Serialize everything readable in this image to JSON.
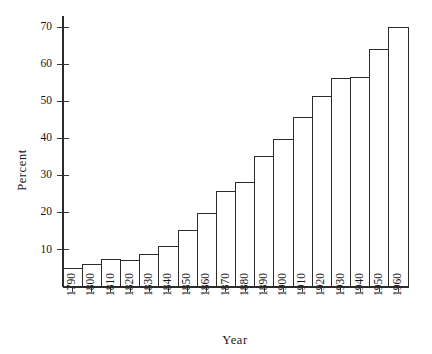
{
  "chart_data": {
    "type": "bar",
    "title": "",
    "xlabel": "Year",
    "ylabel": "Percent",
    "categories": [
      "1790",
      "1800",
      "1810",
      "1820",
      "1830",
      "1840",
      "1850",
      "1860",
      "1870",
      "1880",
      "1890",
      "1900",
      "1910",
      "1920",
      "1930",
      "1940",
      "1950",
      "1960"
    ],
    "values": [
      5.1,
      6.1,
      7.3,
      7.2,
      8.8,
      10.8,
      15.3,
      19.8,
      25.7,
      28.2,
      35.1,
      39.6,
      45.6,
      51.2,
      56.1,
      56.5,
      64.0,
      69.9
    ],
    "ylim": [
      0,
      73
    ],
    "yticks": [
      10,
      20,
      30,
      40,
      50,
      60,
      70
    ],
    "ytick_labels": [
      "10",
      "20",
      "30",
      "40",
      "50",
      "60",
      "70"
    ],
    "grid": false,
    "legend": "none",
    "bar_fill": "#ffffff",
    "bar_stroke": "#2b2b2b",
    "axis_color": "#2b2b2b",
    "xtick_rotation": -90
  },
  "axes": {
    "y_title": "Percent",
    "x_title": "Year"
  }
}
